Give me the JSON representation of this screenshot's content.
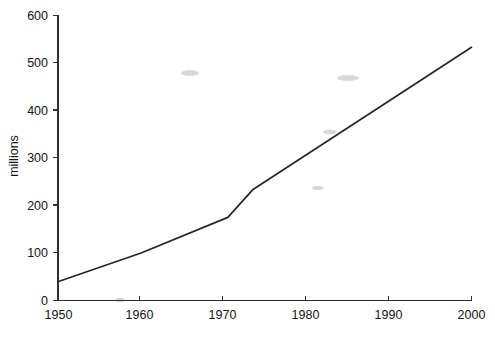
{
  "chart_data": {
    "type": "line",
    "title": "",
    "xlabel": "",
    "ylabel": "millions",
    "xlim": [
      1950,
      2000
    ],
    "ylim": [
      0,
      600
    ],
    "grid": false,
    "legend": null,
    "x_ticks": [
      "1950",
      "1960",
      "1970",
      "1980",
      "1990",
      "2000"
    ],
    "x_tick_values": [
      1950,
      1960,
      1970,
      1980,
      1990,
      2000
    ],
    "y_ticks": [
      "0",
      "100",
      "200",
      "300",
      "400",
      "500",
      "600"
    ],
    "y_tick_values": [
      0,
      100,
      200,
      300,
      400,
      500,
      600
    ],
    "series": [
      {
        "name": "millions",
        "color": "#262626",
        "x": [
          1950,
          1960,
          1970.5,
          1973.5,
          2000
        ],
        "values": [
          40,
          100,
          175,
          233,
          533
        ]
      }
    ]
  },
  "axes": {
    "y_axis_title": "millions",
    "y_tick_0": "0",
    "y_tick_100": "100",
    "y_tick_200": "200",
    "y_tick_300": "300",
    "y_tick_400": "400",
    "y_tick_500": "500",
    "y_tick_600": "600",
    "x_tick_1950": "1950",
    "x_tick_1960": "1960",
    "x_tick_1970": "1970",
    "x_tick_1980": "1980",
    "x_tick_1990": "1990",
    "x_tick_2000": "2000"
  }
}
